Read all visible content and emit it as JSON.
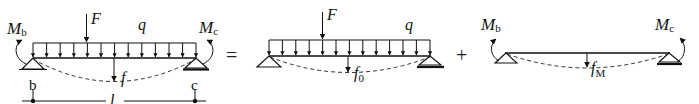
{
  "diagram": {
    "operators": {
      "equals": "=",
      "plus": "+"
    },
    "panels": [
      {
        "id": "total",
        "labels": {
          "moment_left": "M",
          "moment_left_sub": "b",
          "moment_right": "M",
          "moment_right_sub": "c",
          "force": "F",
          "distributed_load": "q",
          "deflection": "f",
          "deflection_sub": "",
          "support_left": "b",
          "support_right": "c",
          "span": "l"
        }
      },
      {
        "id": "loads-only",
        "labels": {
          "force": "F",
          "distributed_load": "q",
          "deflection": "f",
          "deflection_sub": "0"
        }
      },
      {
        "id": "moments-only",
        "labels": {
          "moment_left": "M",
          "moment_left_sub": "b",
          "moment_right": "M",
          "moment_right_sub": "c",
          "deflection": "f",
          "deflection_sub": "M"
        }
      }
    ]
  }
}
